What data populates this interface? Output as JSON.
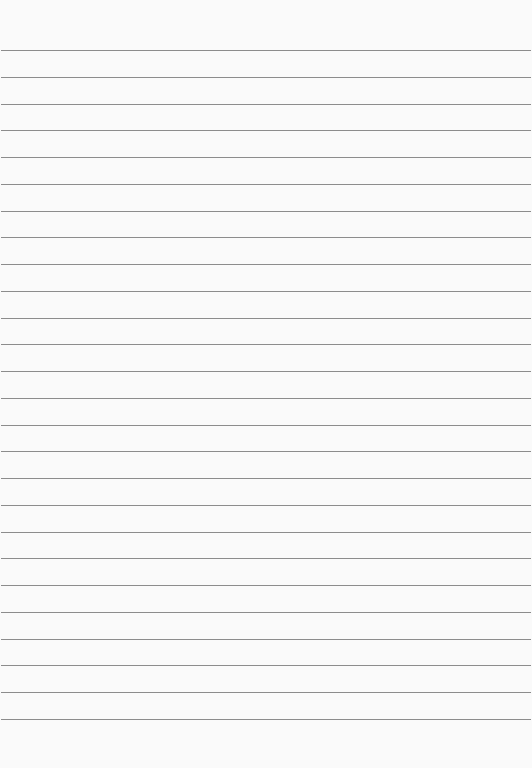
{
  "document": {
    "type": "lined-paper",
    "line_count": 26,
    "first_line_y": 50,
    "line_spacing": 26.76,
    "line_color": "#8c8c8c",
    "paper_color": "#fafafa"
  }
}
